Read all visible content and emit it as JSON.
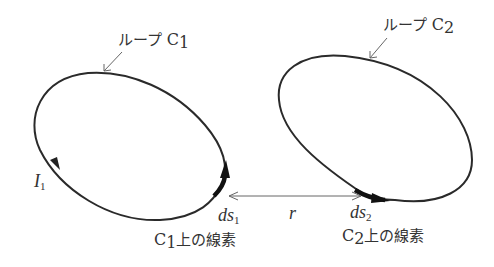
{
  "diagram": {
    "loop1": {
      "label_prefix": "ループ ",
      "label_main": "C",
      "label_sub": "1",
      "current_label": "I",
      "current_sub": "1",
      "element_label": "ds",
      "element_sub": "1",
      "element_caption_main": "C",
      "element_caption_sub": "1",
      "element_caption_suffix": "上の線素"
    },
    "loop2": {
      "label_prefix": "ループ ",
      "label_main": "C",
      "label_sub": "2",
      "element_label": "ds",
      "element_sub": "2",
      "element_caption_main": "C",
      "element_caption_sub": "2",
      "element_caption_suffix": "上の線素"
    },
    "distance_label": "r",
    "colors": {
      "curve": "#2a2a2a",
      "arrow": "#555555",
      "text": "#333333",
      "background": "#ffffff"
    }
  }
}
